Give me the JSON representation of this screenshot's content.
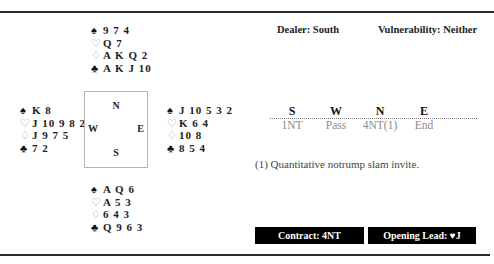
{
  "hands": {
    "north": {
      "spades": "9 7 4",
      "hearts": "Q 7",
      "diamonds": "A K Q 2",
      "clubs": "A K J 10"
    },
    "west": {
      "spades": "K 8",
      "hearts": "J 10 9 8 2",
      "diamonds": "J 9 7 5",
      "clubs": "7 2"
    },
    "east": {
      "spades": "J 10 5 3 2",
      "hearts": "K 6 4",
      "diamonds": "10 8",
      "clubs": "8 5 4"
    },
    "south": {
      "spades": "A Q 6",
      "hearts": "A 5 3",
      "diamonds": "6 4 3",
      "clubs": "Q 9 6 3"
    }
  },
  "suit_icons": {
    "spades": "♠",
    "hearts": "♡",
    "diamonds": "♢",
    "clubs": "♣"
  },
  "compass": {
    "north": "N",
    "west": "W",
    "east": "E",
    "south": "S"
  },
  "meta": {
    "dealer": "Dealer: South",
    "vulnerability": "Vulnerability: Neither"
  },
  "auction": {
    "headers": [
      "S",
      "W",
      "N",
      "E"
    ],
    "bids": [
      "1NT",
      "Pass",
      "4NT(1)",
      "End"
    ]
  },
  "footnote": "(1) Quantitative notrump slam invite.",
  "summary": {
    "contract": "Contract: 4NT",
    "opening_lead": "Opening Lead: ♥J"
  },
  "colors": {
    "badge_bg": "#000000",
    "badge_text": "#ffffff",
    "red_suit": "#9a9a9a",
    "bid_text": "#8a8a8a"
  }
}
